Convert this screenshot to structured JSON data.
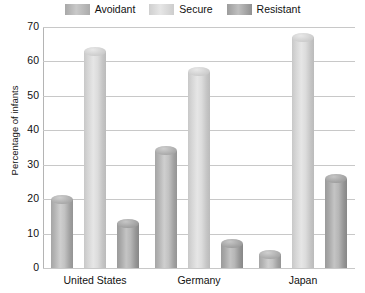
{
  "chart_data": {
    "type": "bar",
    "title": "",
    "xlabel": "",
    "ylabel": "Percentage of infants",
    "categories": [
      "United States",
      "Germany",
      "Japan"
    ],
    "series": [
      {
        "name": "Avoidant",
        "color": "#b0b0b0",
        "values": [
          20,
          34,
          4
        ]
      },
      {
        "name": "Secure",
        "color": "#dcdcdc",
        "values": [
          63,
          57,
          67
        ]
      },
      {
        "name": "Resistant",
        "color": "#a0a0a0",
        "values": [
          13,
          7,
          26
        ]
      }
    ],
    "ylim": [
      0,
      70
    ],
    "yticks": [
      70,
      60,
      50,
      40,
      30,
      20,
      10,
      0
    ],
    "grid": true,
    "legend_position": "top"
  },
  "legend": {
    "items": [
      {
        "label": "Avoidant"
      },
      {
        "label": "Secure"
      },
      {
        "label": "Resistant"
      }
    ]
  },
  "axes": {
    "y_title": "Percentage of infants",
    "y_tick_labels": [
      "70",
      "60",
      "50",
      "40",
      "30",
      "20",
      "10",
      "0"
    ],
    "x_tick_labels": [
      "United States",
      "Germany",
      "Japan"
    ]
  }
}
